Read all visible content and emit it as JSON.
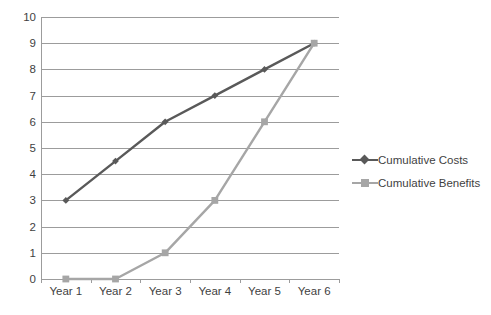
{
  "chart_data": {
    "type": "line",
    "title": "",
    "xlabel": "",
    "ylabel": "",
    "categories": [
      "Year 1",
      "Year 2",
      "Year 3",
      "Year 4",
      "Year 5",
      "Year 6"
    ],
    "series": [
      {
        "name": "Cumulative Costs",
        "values": [
          3,
          4.5,
          6,
          7,
          8,
          9
        ],
        "color": "#595959",
        "marker": "diamond"
      },
      {
        "name": "Cumulative Benefits",
        "values": [
          0,
          0,
          1,
          3,
          6,
          9
        ],
        "color": "#a6a6a6",
        "marker": "square"
      }
    ],
    "ylim": [
      0,
      10
    ],
    "ytick_step": 1,
    "yticks": [
      "10",
      "9",
      "8",
      "7",
      "6",
      "5",
      "4",
      "3",
      "2",
      "1",
      "0"
    ],
    "grid": "horizontal",
    "legend_position": "right"
  },
  "axes": {
    "gridline_color": "#9c9c9c",
    "tick_label_color": "#3f3f3f"
  }
}
